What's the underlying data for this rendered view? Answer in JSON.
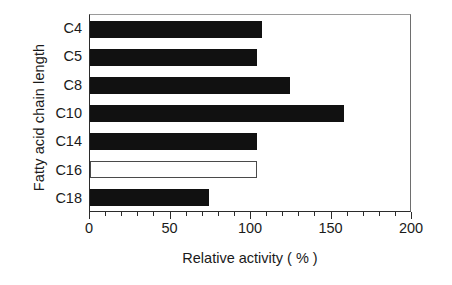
{
  "chart_data": {
    "type": "bar",
    "orientation": "horizontal",
    "title": "",
    "xlabel": "Relative activity ( % )",
    "ylabel": "Fatty acid chain length",
    "categories": [
      "C4",
      "C5",
      "C8",
      "C10",
      "C14",
      "C16",
      "C18"
    ],
    "values": [
      107,
      104,
      124,
      158,
      104,
      104,
      74
    ],
    "bar_styles": [
      "filled",
      "filled",
      "filled",
      "filled",
      "filled",
      "hollow",
      "filled"
    ],
    "xlim": [
      0,
      200
    ],
    "xticks": [
      0,
      50,
      100,
      150,
      200
    ],
    "xtick_labels": [
      "0",
      "50",
      "100",
      "150",
      "200"
    ],
    "xminor_tick_interval": 10,
    "grid": false,
    "legend": null,
    "colors": {
      "bar_fill": "#111111",
      "bar_hollow_fill": "#ffffff",
      "bar_hollow_stroke": "#4a4a4a",
      "axis": "#2b2b2b",
      "background": "#ffffff",
      "text": "#1a1a1a"
    }
  }
}
